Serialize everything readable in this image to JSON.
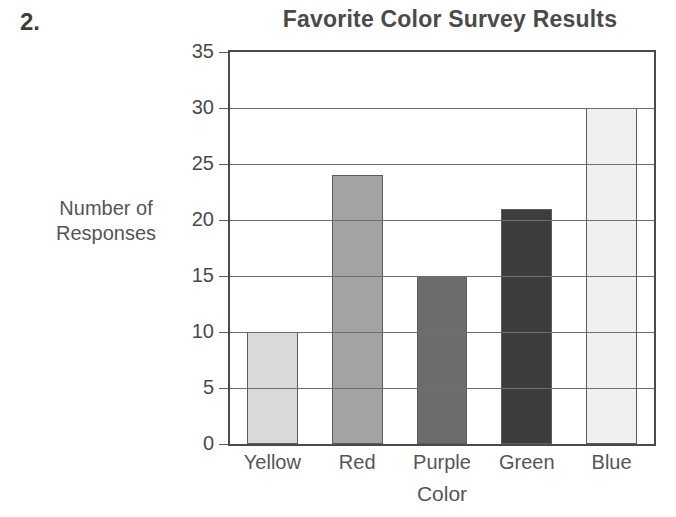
{
  "question_number": "2.",
  "chart_data": {
    "type": "bar",
    "title": "Favorite Color Survey Results",
    "xlabel": "Color",
    "ylabel": "Number of Responses",
    "ylabel_lines": [
      "Number of",
      "Responses"
    ],
    "categories": [
      "Yellow",
      "Red",
      "Purple",
      "Green",
      "Blue"
    ],
    "values": [
      10,
      24,
      15,
      21,
      30
    ],
    "ylim": [
      0,
      35
    ],
    "yticks": [
      0,
      5,
      10,
      15,
      20,
      25,
      30,
      35
    ],
    "ytick_labels": [
      "0",
      "5",
      "10",
      "15",
      "20",
      "25",
      "30",
      "35"
    ],
    "grid": true,
    "grid_axis": "y",
    "legend": false,
    "bar_colors": [
      "#d9d9d9",
      "#a3a3a3",
      "#6d6d6d",
      "#3d3d3d",
      "#f0f0f0"
    ],
    "bar_border_color": "#5c5c5c",
    "axis_color": "#4a4a4a",
    "grid_color": "#6e6e6e",
    "background": "#ffffff",
    "title_color": "#4a4a4a",
    "label_color": "#555555"
  }
}
